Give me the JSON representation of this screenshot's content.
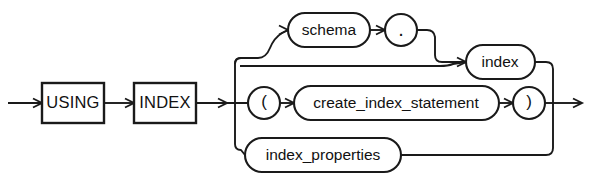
{
  "diagram": {
    "kind": "railroad-syntax-diagram",
    "name": "using_index_clause",
    "background_color": "#ffffff",
    "line_color": "#1a1a1a",
    "text_color": "#111111"
  },
  "nodes": {
    "using_keyword": {
      "label": "USING",
      "shape": "rectangle",
      "type": "keyword",
      "x": 42,
      "y": 83,
      "w": 62,
      "h": 40
    },
    "index_keyword": {
      "label": "INDEX",
      "shape": "rectangle",
      "type": "keyword",
      "x": 134,
      "y": 83,
      "w": 62,
      "h": 40
    },
    "schema": {
      "label": "schema",
      "shape": "stadium",
      "type": "nonterminal",
      "x": 288,
      "y": 13,
      "w": 82,
      "h": 34
    },
    "period": {
      "label": ".",
      "shape": "circle",
      "type": "terminal",
      "cx": 401,
      "cy": 30,
      "r": 16
    },
    "index": {
      "label": "index",
      "shape": "stadium",
      "type": "nonterminal",
      "x": 466,
      "y": 45,
      "w": 69,
      "h": 34
    },
    "lparen": {
      "label": "(",
      "shape": "circle",
      "type": "terminal",
      "cx": 264,
      "cy": 103,
      "r": 16
    },
    "create_index_statement": {
      "label": "create_index_statement",
      "shape": "stadium",
      "type": "nonterminal",
      "x": 294,
      "y": 86,
      "w": 205,
      "h": 34
    },
    "rparen": {
      "label": ")",
      "shape": "circle",
      "type": "terminal",
      "cx": 529,
      "cy": 103,
      "r": 16
    },
    "index_properties": {
      "label": "index_properties",
      "shape": "stadium",
      "type": "nonterminal",
      "x": 245,
      "y": 138,
      "w": 156,
      "h": 34
    }
  },
  "rails": {
    "entry_arrow": "left entry into USING",
    "using_to_index": "arrow from USING to INDEX",
    "index_to_bus": "arrow from INDEX to left branch bus",
    "left_bus_x": 235,
    "right_bus_x": 553,
    "main_line_y": 103,
    "schema_line_y": 58,
    "index_line_y": 62,
    "properties_line_y": 155,
    "exit_arrow": "right exit from right bus"
  }
}
